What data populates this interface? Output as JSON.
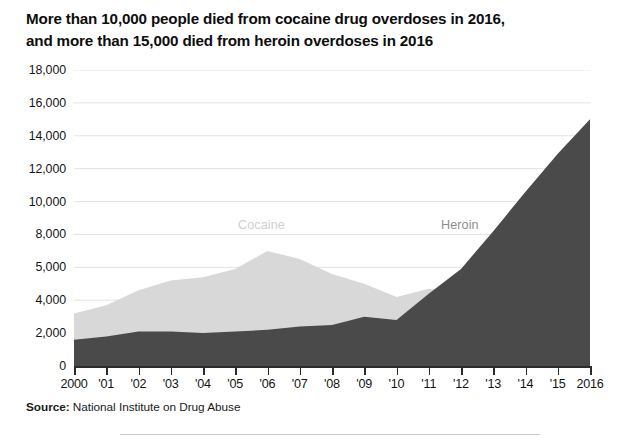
{
  "title": {
    "line1": "More than 10,000 people died from cocaine drug overdoses in 2016,",
    "line2": "and more than 15,000 died from heroin overdoses in 2016"
  },
  "source": {
    "label": "Source:",
    "text": " National Institute on Drug Abuse"
  },
  "chart_data": {
    "type": "area",
    "title": "More than 10,000 people died from cocaine drug overdoses in 2016, and more than 15,000 died from heroin overdoses in 2016",
    "subtitle": "",
    "xlabel": "",
    "ylabel": "",
    "stacked": false,
    "grid": true,
    "legend_position": "inline-annotation",
    "xlim": [
      2000,
      2016
    ],
    "ylim": [
      0,
      18000
    ],
    "x": [
      2000,
      2001,
      2002,
      2003,
      2004,
      2005,
      2006,
      2007,
      2008,
      2009,
      2010,
      2011,
      2012,
      2013,
      2014,
      2015,
      2016
    ],
    "categories": [
      "2000",
      "'01",
      "'02",
      "'03",
      "'04",
      "'05",
      "'06",
      "'07",
      "'08",
      "'09",
      "'10",
      "'11",
      "'12",
      "'13",
      "'14",
      "'15",
      "2016"
    ],
    "x_tick_labels": [
      "2000",
      "'01",
      "'02",
      "'03",
      "'04",
      "'05",
      "'06",
      "'07",
      "'08",
      "'09",
      "'10",
      "'11",
      "'12",
      "'13",
      "'14",
      "'15",
      "2016"
    ],
    "y_tick_labels": [
      "0",
      "2,000",
      "4,000",
      "5,000",
      "8,000",
      "10,000",
      "12,000",
      "14,000",
      "16,000",
      "18,000"
    ],
    "y_tick_values": [
      0,
      2000,
      4000,
      6000,
      8000,
      10000,
      12000,
      14000,
      16000,
      18000
    ],
    "series": [
      {
        "name": "Cocaine",
        "color": "#d8d8d8",
        "label_color": "#cfcfcf",
        "values": [
          3200,
          3700,
          4600,
          5200,
          5400,
          5900,
          7000,
          6500,
          5600,
          5000,
          4200,
          4700,
          4500,
          4900,
          5400,
          6700,
          10400
        ]
      },
      {
        "name": "Heroin",
        "color": "#4a4a4a",
        "label_color": "#8e8e8e",
        "values": [
          1600,
          1800,
          2100,
          2100,
          2000,
          2100,
          2200,
          2400,
          2500,
          3000,
          2800,
          4400,
          5900,
          8200,
          10600,
          12900,
          15000
        ]
      }
    ],
    "annotations": [
      {
        "text": "Cocaine",
        "series": "Cocaine",
        "x": 2006,
        "color": "#cfcfcf"
      },
      {
        "text": "Heroin",
        "series": "Heroin",
        "x": 2012,
        "color": "#8e8e8e"
      }
    ]
  }
}
